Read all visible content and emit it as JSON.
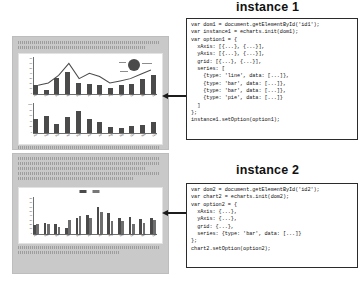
{
  "diagram": {
    "kind": "echarts-instance-diagram",
    "panels": [
      {
        "id": "panel-top",
        "label": "webpage-mock-top"
      },
      {
        "id": "panel-bottom",
        "label": "webpage-mock-bottom"
      }
    ]
  },
  "instance1": {
    "title": "instance 1",
    "code": [
      "var dom1 = document.getElementById('id1');",
      "var instance1 = echarts.init(dom1);",
      "var option1 = {",
      "  xAxis: [{...}, {...}],",
      "  yAxis: [{...}, {...}],",
      "  grid: [{...}, {...}],",
      "  series: [",
      "    {type: 'line', data: [...]},",
      "    {type: 'bar', data: [...]},",
      "    {type: 'bar', data: [...]},",
      "    {type: 'pie', data: [...]}",
      "  ]",
      "};",
      "instance1.setOption(option1);"
    ]
  },
  "instance2": {
    "title": "instance 2",
    "code": [
      "var dom2 = document.getElementById('id2');",
      "var chart2 = echarts.init(dom2);",
      "var option2 = {",
      "  xAxis: {...},",
      "  yAxis: {...},",
      "  grid: {...},",
      "  series: {type: 'bar', data: [...]}",
      "};",
      "chart2.setOption(option2);"
    ]
  },
  "chart_data": [
    {
      "type": "bar",
      "id": "chart-top-upper",
      "title": "",
      "xlabel": "",
      "ylabel": "",
      "categories": [
        "Jan",
        "Feb",
        "Mar",
        "Apr",
        "May",
        "Jun",
        "Jul",
        "Aug",
        "Sep",
        "Oct",
        "Nov",
        "Dec"
      ],
      "ytick_labels": [
        "70",
        "60",
        "50",
        "40",
        "30",
        "20",
        "10",
        "0"
      ],
      "ylim": [
        0,
        70
      ],
      "grid": false,
      "legend": "none",
      "series": [
        {
          "name": "bar",
          "type": "bar",
          "values": [
            22,
            10,
            38,
            52,
            26,
            24,
            22,
            14,
            20,
            24,
            36,
            44
          ]
        },
        {
          "name": "line",
          "type": "line",
          "values": [
            18,
            22,
            36,
            58,
            30,
            40,
            34,
            22,
            26,
            30,
            38,
            46
          ]
        },
        {
          "name": "pie",
          "type": "pie",
          "values": [
            60,
            25,
            15
          ]
        }
      ]
    },
    {
      "type": "bar",
      "id": "chart-top-lower",
      "title": "",
      "xlabel": "",
      "ylabel": "",
      "categories": [
        "Jan",
        "Feb",
        "Mar",
        "Apr",
        "May",
        "Jun",
        "Jul",
        "Aug",
        "Sep",
        "Oct",
        "Nov",
        "Dec"
      ],
      "ytick_labels": [
        "100",
        "80",
        "60",
        "40",
        "20",
        "0"
      ],
      "ylim": [
        0,
        100
      ],
      "grid": false,
      "legend": "none",
      "series": [
        {
          "name": "bar",
          "type": "bar",
          "values": [
            62,
            74,
            40,
            70,
            94,
            62,
            48,
            28,
            20,
            30,
            34,
            50
          ]
        }
      ]
    },
    {
      "type": "bar",
      "id": "chart-bottom",
      "title": "",
      "xlabel": "",
      "ylabel": "",
      "categories": [
        "Jan",
        "Feb",
        "Mar",
        "Apr",
        "May",
        "Jun",
        "Jul",
        "Aug",
        "Sep",
        "Oct",
        "Nov",
        "Dec"
      ],
      "ytick_labels": [
        "80",
        "70",
        "60",
        "50",
        "40",
        "30",
        "20",
        "10",
        "0"
      ],
      "ylim": [
        0,
        80
      ],
      "grid": false,
      "legend": "top-center",
      "legend_entries": [
        "",
        ""
      ],
      "series": [
        {
          "name": "series-a",
          "type": "bar",
          "values": [
            24,
            30,
            28,
            16,
            44,
            50,
            72,
            56,
            42,
            46,
            40,
            44
          ]
        },
        {
          "name": "series-b",
          "type": "bar",
          "values": [
            28,
            26,
            18,
            38,
            48,
            44,
            58,
            34,
            36,
            26,
            30,
            38
          ]
        }
      ]
    }
  ],
  "arrows": [
    {
      "name": "arrow-instance1",
      "direction": "left"
    },
    {
      "name": "arrow-instance2",
      "direction": "left"
    }
  ]
}
